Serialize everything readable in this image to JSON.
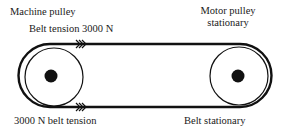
{
  "labels": {
    "machine_pulley": "Machine pulley",
    "top_tension": "Belt tension 3000 N",
    "motor_pulley_line1": "Motor pulley",
    "motor_pulley_line2": "stationary",
    "bottom_tension": "3000 N belt tension",
    "belt_stationary": "Belt stationary"
  },
  "colors": {
    "stroke": "#111111",
    "background": "#ffffff"
  },
  "icons": {
    "direction_arrows": "triple-chevron-right"
  }
}
